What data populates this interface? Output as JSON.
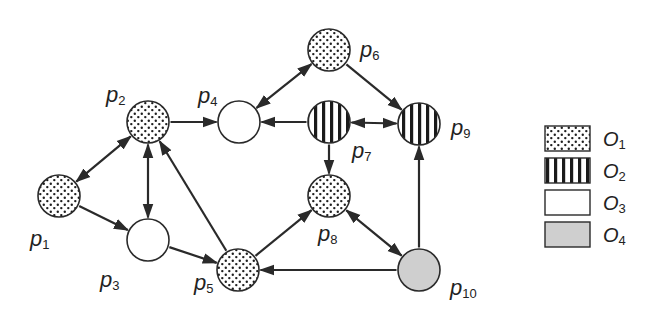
{
  "diagram": {
    "nodes": [
      {
        "id": "p1",
        "label": "p",
        "sub": "1",
        "type": "O1",
        "x": 59,
        "y": 196,
        "lx": 30,
        "ly": 246
      },
      {
        "id": "p2",
        "label": "p",
        "sub": "2",
        "type": "O1",
        "x": 148,
        "y": 122,
        "lx": 106,
        "ly": 102
      },
      {
        "id": "p3",
        "label": "p",
        "sub": "3",
        "type": "O3",
        "x": 148,
        "y": 240,
        "lx": 100,
        "ly": 287
      },
      {
        "id": "p4",
        "label": "p",
        "sub": "4",
        "type": "O3",
        "x": 239,
        "y": 122,
        "lx": 198,
        "ly": 103
      },
      {
        "id": "p5",
        "label": "p",
        "sub": "5",
        "type": "O1",
        "x": 238,
        "y": 270,
        "lx": 194,
        "ly": 290
      },
      {
        "id": "p6",
        "label": "p",
        "sub": "6",
        "type": "O1",
        "x": 329,
        "y": 50,
        "lx": 360,
        "ly": 57
      },
      {
        "id": "p7",
        "label": "p",
        "sub": "7",
        "type": "O2",
        "x": 329,
        "y": 122,
        "lx": 352,
        "ly": 158
      },
      {
        "id": "p8",
        "label": "p",
        "sub": "8",
        "type": "O1",
        "x": 329,
        "y": 196,
        "lx": 318,
        "ly": 241
      },
      {
        "id": "p9",
        "label": "p",
        "sub": "9",
        "type": "O2",
        "x": 419,
        "y": 124,
        "lx": 451,
        "ly": 135
      },
      {
        "id": "p10",
        "label": "p",
        "sub": "10",
        "type": "O4",
        "x": 419,
        "y": 270,
        "lx": 450,
        "ly": 295
      }
    ],
    "edges": [
      {
        "from": "p1",
        "to": "p2",
        "bidirectional": true
      },
      {
        "from": "p1",
        "to": "p3",
        "bidirectional": false
      },
      {
        "from": "p2",
        "to": "p3",
        "bidirectional": true
      },
      {
        "from": "p2",
        "to": "p4",
        "bidirectional": false
      },
      {
        "from": "p5",
        "to": "p2",
        "bidirectional": false
      },
      {
        "from": "p3",
        "to": "p5",
        "bidirectional": false
      },
      {
        "from": "p4",
        "to": "p6",
        "bidirectional": true
      },
      {
        "from": "p7",
        "to": "p4",
        "bidirectional": false
      },
      {
        "from": "p6",
        "to": "p9",
        "bidirectional": false
      },
      {
        "from": "p7",
        "to": "p9",
        "bidirectional": true
      },
      {
        "from": "p7",
        "to": "p8",
        "bidirectional": false
      },
      {
        "from": "p5",
        "to": "p8",
        "bidirectional": false
      },
      {
        "from": "p8",
        "to": "p10",
        "bidirectional": true
      },
      {
        "from": "p10",
        "to": "p5",
        "bidirectional": false
      },
      {
        "from": "p10",
        "to": "p9",
        "bidirectional": false
      }
    ],
    "node_radius": 21
  },
  "legend": {
    "items": [
      {
        "type": "O1",
        "label": "O",
        "sub": "1",
        "pattern": "dots"
      },
      {
        "type": "O2",
        "label": "O",
        "sub": "2",
        "pattern": "stripes"
      },
      {
        "type": "O3",
        "label": "O",
        "sub": "3",
        "pattern": "blank"
      },
      {
        "type": "O4",
        "label": "O",
        "sub": "4",
        "pattern": "gray"
      }
    ]
  },
  "colors": {
    "stroke": "#2a2a2a",
    "gray_fill": "#cfcfcf",
    "white_fill": "#ffffff",
    "dot": "#1e1e1e"
  }
}
